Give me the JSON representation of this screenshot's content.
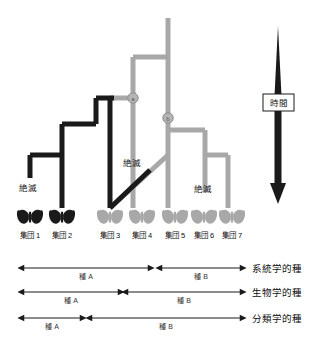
{
  "figure": {
    "colors": {
      "black_lineage": "#1a1a1a",
      "gray_lineage": "#a8a8a8",
      "node_circle": "#9a9a9a",
      "text": "#111111",
      "background": "#ffffff"
    }
  },
  "time_axis": {
    "label": "時間",
    "direction": "downward"
  },
  "extinction_labels": [
    {
      "id": "extinct-left",
      "text": "絶滅"
    },
    {
      "id": "extinct-middle",
      "text": "絶滅"
    },
    {
      "id": "extinct-right",
      "text": "絶滅"
    }
  ],
  "nodes": [
    {
      "id": "node-a",
      "label": "a"
    },
    {
      "id": "node-b",
      "label": "b"
    }
  ],
  "populations": [
    {
      "id": "pop-1",
      "label": "集団 1",
      "color": "dark"
    },
    {
      "id": "pop-2",
      "label": "集団 2",
      "color": "dark"
    },
    {
      "id": "pop-3",
      "label": "集団 3",
      "color": "gray"
    },
    {
      "id": "pop-4",
      "label": "集団 4",
      "color": "gray"
    },
    {
      "id": "pop-5",
      "label": "集団 5",
      "color": "gray"
    },
    {
      "id": "pop-6",
      "label": "集団 6",
      "color": "gray"
    },
    {
      "id": "pop-7",
      "label": "集団 7",
      "color": "gray"
    }
  ],
  "species_concepts": [
    {
      "id": "phylogenetic",
      "name": "系統学的種",
      "ranges": [
        {
          "label": "種 A",
          "from_population": 1,
          "to_population": 4
        },
        {
          "label": "種 B",
          "from_population": 5,
          "to_population": 7
        }
      ]
    },
    {
      "id": "biological",
      "name": "生物学的種",
      "ranges": [
        {
          "label": "種 A",
          "from_population": 1,
          "to_population": 3
        },
        {
          "label": "種 B",
          "from_population": 4,
          "to_population": 7
        }
      ]
    },
    {
      "id": "taxonomic",
      "name": "分類学的種",
      "ranges": [
        {
          "label": "種 A",
          "from_population": 1,
          "to_population": 2
        },
        {
          "label": "種 B",
          "from_population": 3,
          "to_population": 7
        }
      ]
    }
  ]
}
